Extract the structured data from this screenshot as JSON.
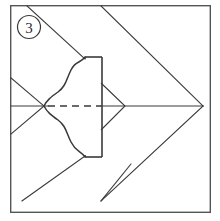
{
  "figure": {
    "step_label": "3",
    "line_color": "#3a3a3a",
    "frame_color": "#555555",
    "background_color": "#ffffff",
    "dash_color": "#3a3a3a",
    "canvas": {
      "width": 220,
      "height": 221
    }
  },
  "frame": {
    "x": 10,
    "y": 5,
    "width": 201,
    "height": 208,
    "stroke_width": 1.4
  },
  "badge": {
    "label": "3",
    "center_x": 29,
    "center_y": 27,
    "radius": 11.5,
    "stroke_width": 1.2
  },
  "geometry": {
    "center_axis_y": 106,
    "left_cross_x": 44,
    "right_vertex_x": 203,
    "rect": {
      "left": 85,
      "right": 102,
      "top": 57,
      "bottom": 157
    },
    "dash_start_x": 48,
    "dash_end_x": 101,
    "small_triangle": {
      "back_x": 101,
      "tip_x": 125,
      "top_y": 83,
      "bottom_y": 130
    }
  },
  "strokes": [
    {
      "name": "horizontal-axis-line",
      "kind": "solid"
    },
    {
      "name": "dashed-center-line",
      "kind": "dashed"
    },
    {
      "name": "upper-right-chevron-line",
      "kind": "solid"
    },
    {
      "name": "lower-right-chevron-line",
      "kind": "solid"
    },
    {
      "name": "upper-left-diagonal-crease",
      "kind": "solid"
    },
    {
      "name": "lower-left-diagonal-crease",
      "kind": "solid"
    },
    {
      "name": "upper-wavy-edge",
      "kind": "curve"
    },
    {
      "name": "lower-wavy-edge",
      "kind": "curve"
    },
    {
      "name": "center-rectangle",
      "kind": "solid"
    },
    {
      "name": "small-right-triangle",
      "kind": "solid"
    }
  ]
}
